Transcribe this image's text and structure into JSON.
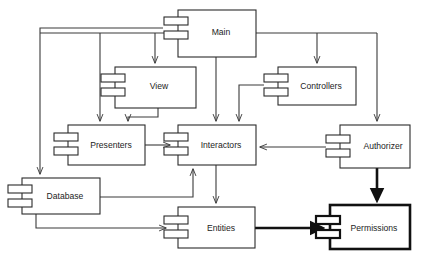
{
  "diagram": {
    "type": "uml-component-diagram",
    "canvas": {
      "width": 422,
      "height": 257
    },
    "colors": {
      "background": "#ffffff",
      "stroke": "#2b2b2b",
      "stroke_bold": "#111111",
      "connector": "#3a3a3a",
      "label": "#1c1c1c"
    },
    "components": [
      {
        "id": "main",
        "label": "Main",
        "x": 178,
        "y": 10,
        "w": 78,
        "h": 47,
        "bold": false,
        "lollipop_side": "left",
        "lollipop_y": 28,
        "lollipop_bold": false,
        "label_x": 221,
        "label_y": 33
      },
      {
        "id": "view",
        "label": "View",
        "x": 115,
        "y": 67,
        "w": 81,
        "h": 41,
        "bold": false,
        "lollipop_side": "left",
        "lollipop_y": 85,
        "lollipop_bold": false,
        "label_x": 159,
        "label_y": 86
      },
      {
        "id": "controllers",
        "label": "Controllers",
        "x": 278,
        "y": 67,
        "w": 78,
        "h": 38,
        "bold": false,
        "lollipop_side": "left",
        "lollipop_y": 85,
        "lollipop_bold": false,
        "label_x": 319,
        "label_y": 86
      },
      {
        "id": "presenters",
        "label": "Presenters",
        "x": 68,
        "y": 125,
        "w": 77,
        "h": 40,
        "bold": false,
        "lollipop_side": "left",
        "lollipop_y": 145,
        "lollipop_bold": false,
        "label_x": 110,
        "label_y": 146
      },
      {
        "id": "interactors",
        "label": "Interactors",
        "x": 178,
        "y": 125,
        "w": 78,
        "h": 40,
        "bold": false,
        "lollipop_side": "left",
        "lollipop_y": 145,
        "lollipop_bold": false,
        "label_x": 221,
        "label_y": 146
      },
      {
        "id": "authorizer",
        "label": "Authorizer",
        "x": 340,
        "y": 125,
        "w": 70,
        "h": 43,
        "bold": false,
        "lollipop_side": "left",
        "lollipop_y": 147,
        "lollipop_bold": false,
        "label_x": 382,
        "label_y": 147
      },
      {
        "id": "database",
        "label": "Database",
        "x": 22,
        "y": 178,
        "w": 78,
        "h": 36,
        "bold": false,
        "lollipop_side": "left",
        "lollipop_y": 196,
        "lollipop_bold": false,
        "label_x": 64,
        "label_y": 197
      },
      {
        "id": "entities",
        "label": "Entities",
        "x": 178,
        "y": 207,
        "w": 77,
        "h": 41,
        "bold": false,
        "lollipop_side": "left",
        "lollipop_y": 228,
        "lollipop_bold": false,
        "label_x": 220,
        "label_y": 229
      },
      {
        "id": "permissions",
        "label": "Permissions",
        "x": 330,
        "y": 205,
        "w": 80,
        "h": 44,
        "bold": true,
        "lollipop_side": "left",
        "lollipop_y": 228,
        "lollipop_bold": true,
        "label_x": 375,
        "label_y": 229
      }
    ],
    "connections": [
      {
        "id": "main-to-left-bus",
        "from": "main",
        "to": "bus-left",
        "bold": false,
        "arrow": false
      },
      {
        "id": "main-to-database",
        "from": "main",
        "to": "database",
        "bold": false,
        "arrow": true
      },
      {
        "id": "main-to-presenters",
        "from": "main",
        "to": "presenters",
        "bold": false,
        "arrow": true
      },
      {
        "id": "main-to-view",
        "from": "main",
        "to": "view",
        "bold": false,
        "arrow": true
      },
      {
        "id": "main-to-interactors",
        "from": "main",
        "to": "interactors",
        "bold": false,
        "arrow": true
      },
      {
        "id": "main-to-controllers",
        "from": "main",
        "to": "controllers",
        "bold": false,
        "arrow": true
      },
      {
        "id": "main-to-authorizer",
        "from": "main",
        "to": "authorizer",
        "bold": false,
        "arrow": true
      },
      {
        "id": "view-to-presenters",
        "from": "view",
        "to": "presenters",
        "bold": false,
        "arrow": true
      },
      {
        "id": "controllers-to-interactors",
        "from": "controllers",
        "to": "interactors",
        "bold": false,
        "arrow": true
      },
      {
        "id": "presenters-to-interactors",
        "from": "presenters",
        "to": "interactors",
        "bold": false,
        "arrow": true
      },
      {
        "id": "authorizer-to-interactors",
        "from": "authorizer",
        "to": "interactors",
        "bold": false,
        "arrow": true
      },
      {
        "id": "database-to-interactors",
        "from": "database",
        "to": "interactors",
        "bold": false,
        "arrow": true
      },
      {
        "id": "database-to-entities",
        "from": "database",
        "to": "entities",
        "bold": false,
        "arrow": true
      },
      {
        "id": "interactors-to-entities",
        "from": "interactors",
        "to": "entities",
        "bold": false,
        "arrow": true
      },
      {
        "id": "entities-to-permissions",
        "from": "entities",
        "to": "permissions",
        "bold": true,
        "arrow": true
      },
      {
        "id": "authorizer-to-permissions",
        "from": "authorizer",
        "to": "permissions",
        "bold": true,
        "arrow": true
      }
    ]
  }
}
